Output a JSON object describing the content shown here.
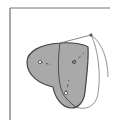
{
  "diagram": {
    "type": "vector-bezier-illustration",
    "colors": {
      "background": "#ffffff",
      "frame": "#555555",
      "heart_fill": "#a9a9a9",
      "heart_stroke": "#444444",
      "guide_curve": "#777777",
      "handle_line": "#666666",
      "anchor_fill": "#ffffff",
      "anchor_stroke": "#444444"
    },
    "frame": {
      "left_line": {
        "x": 10,
        "y1": 8,
        "y2": 120
      },
      "top_line": {
        "y": 8,
        "x1": 10,
        "x2": 110
      }
    },
    "anchors": [
      {
        "name": "left-lobe-center",
        "x": 40,
        "y": 62
      },
      {
        "name": "right-lobe-center",
        "x": 74,
        "y": 62
      },
      {
        "name": "bottom-point",
        "x": 66,
        "y": 93
      },
      {
        "name": "top-right-handle",
        "x": 91,
        "y": 35
      }
    ]
  }
}
